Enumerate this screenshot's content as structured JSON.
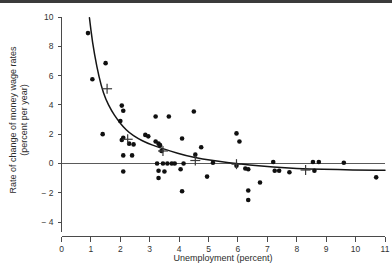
{
  "chart_data": {
    "type": "scatter",
    "title": "",
    "xlabel": "Unemployment (percent)",
    "ylabel_line1": "Rate of change of money wage rates",
    "ylabel_line2": "(percent per year)",
    "xlim": [
      0,
      11
    ],
    "ylim": [
      -4,
      10
    ],
    "xticks": [
      0,
      1,
      2,
      3,
      4,
      5,
      6,
      7,
      8,
      9,
      10,
      11
    ],
    "xtick_labels": [
      "0",
      "1",
      "2",
      "3",
      "4",
      "5",
      "6",
      "7",
      "8",
      "9",
      "10",
      "11"
    ],
    "yticks": [
      -4,
      -2,
      0,
      2,
      4,
      6,
      8,
      10
    ],
    "ytick_labels": [
      "− 4",
      "− 2",
      "0",
      "2",
      "4",
      "6",
      "8",
      "10"
    ],
    "grid": false,
    "legend": null,
    "zero_reference_line": 0,
    "series": [
      {
        "name": "observations",
        "marker": "filled-circle",
        "color": "#101010",
        "points": [
          [
            0.9,
            8.9
          ],
          [
            1.05,
            5.75
          ],
          [
            1.5,
            6.85
          ],
          [
            1.4,
            2.0
          ],
          [
            2.05,
            3.95
          ],
          [
            2.1,
            3.6
          ],
          [
            2.0,
            2.9
          ],
          [
            2.1,
            1.75
          ],
          [
            2.05,
            1.6
          ],
          [
            2.1,
            0.55
          ],
          [
            2.3,
            1.35
          ],
          [
            2.45,
            1.3
          ],
          [
            2.4,
            0.55
          ],
          [
            2.1,
            -0.55
          ],
          [
            2.85,
            1.95
          ],
          [
            2.95,
            1.85
          ],
          [
            3.2,
            3.2
          ],
          [
            3.2,
            1.5
          ],
          [
            3.3,
            1.35
          ],
          [
            3.35,
            1.25
          ],
          [
            3.4,
            0.85
          ],
          [
            3.25,
            0.0
          ],
          [
            3.45,
            0.0
          ],
          [
            3.6,
            0.0
          ],
          [
            3.75,
            0.0
          ],
          [
            3.85,
            0.0
          ],
          [
            3.65,
            3.2
          ],
          [
            3.3,
            -0.5
          ],
          [
            3.3,
            -1.0
          ],
          [
            3.5,
            -0.55
          ],
          [
            4.1,
            1.7
          ],
          [
            4.05,
            -0.4
          ],
          [
            4.15,
            0.0
          ],
          [
            4.1,
            -1.9
          ],
          [
            4.5,
            3.55
          ],
          [
            4.55,
            0.6
          ],
          [
            4.75,
            1.1
          ],
          [
            4.95,
            -0.9
          ],
          [
            5.15,
            0.05
          ],
          [
            5.95,
            2.05
          ],
          [
            6.05,
            1.5
          ],
          [
            5.95,
            -0.15
          ],
          [
            6.25,
            -0.35
          ],
          [
            6.35,
            -0.4
          ],
          [
            6.35,
            -1.85
          ],
          [
            6.35,
            -2.5
          ],
          [
            6.75,
            -1.3
          ],
          [
            7.2,
            0.1
          ],
          [
            7.25,
            -0.5
          ],
          [
            7.4,
            -0.5
          ],
          [
            7.75,
            -0.6
          ],
          [
            8.55,
            0.1
          ],
          [
            8.6,
            -0.5
          ],
          [
            8.75,
            0.1
          ],
          [
            9.6,
            0.05
          ],
          [
            10.7,
            -0.95
          ]
        ]
      },
      {
        "name": "group-means",
        "marker": "plus-cross",
        "color": "#3a3a3a",
        "points": [
          [
            1.55,
            5.1
          ],
          [
            2.25,
            1.65
          ],
          [
            3.45,
            0.85
          ],
          [
            4.55,
            0.2
          ],
          [
            5.95,
            -0.05
          ],
          [
            8.3,
            -0.45
          ]
        ]
      },
      {
        "name": "fitted-phillips-curve",
        "marker": "line",
        "color": "#151515",
        "points": [
          [
            0.95,
            9.95
          ],
          [
            1.05,
            8.3
          ],
          [
            1.2,
            6.6
          ],
          [
            1.35,
            5.3
          ],
          [
            1.5,
            4.4
          ],
          [
            1.7,
            3.6
          ],
          [
            1.9,
            3.0
          ],
          [
            2.1,
            2.5
          ],
          [
            2.3,
            2.1
          ],
          [
            2.6,
            1.7
          ],
          [
            2.9,
            1.4
          ],
          [
            3.3,
            1.1
          ],
          [
            3.7,
            0.85
          ],
          [
            4.2,
            0.55
          ],
          [
            4.8,
            0.3
          ],
          [
            5.4,
            0.12
          ],
          [
            6.0,
            -0.02
          ],
          [
            6.8,
            -0.18
          ],
          [
            7.6,
            -0.3
          ],
          [
            8.4,
            -0.38
          ],
          [
            9.4,
            -0.43
          ],
          [
            10.4,
            -0.46
          ],
          [
            11.0,
            -0.47
          ]
        ]
      }
    ]
  }
}
